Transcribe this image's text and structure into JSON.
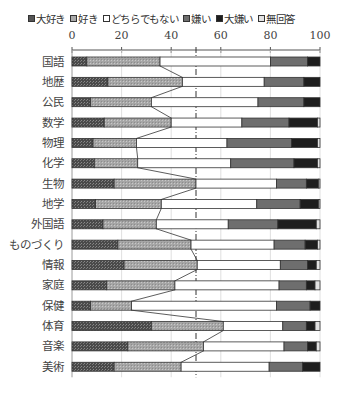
{
  "chart_data": {
    "type": "bar",
    "orientation": "horizontal",
    "stacked": true,
    "percent": true,
    "title": "",
    "xlabel": "",
    "ylabel": "",
    "xlim": [
      0,
      100
    ],
    "xticks": [
      "0",
      "20",
      "40",
      "60",
      "80",
      "100"
    ],
    "reference_line": 50,
    "legend_position": "top",
    "categories": [
      "国語",
      "地歴",
      "公民",
      "数学",
      "物理",
      "化学",
      "生物",
      "地学",
      "外国語",
      "ものづくり",
      "情報",
      "家庭",
      "保健",
      "体育",
      "音楽",
      "美術"
    ],
    "series": [
      {
        "name": "大好き",
        "color": "#5a5a5a",
        "pattern": "dots-dark",
        "values": [
          6,
          14.5,
          7.5,
          13,
          8.5,
          9,
          17,
          9.5,
          12.5,
          18.5,
          21,
          14,
          7.5,
          32,
          22.5,
          17
        ]
      },
      {
        "name": "好き",
        "color": "#a8a8a8",
        "pattern": "dots-light",
        "values": [
          29.5,
          30,
          24.5,
          27,
          17.5,
          17.5,
          33,
          26.5,
          21.5,
          29.5,
          29.5,
          27.5,
          16.5,
          29,
          30.5,
          27
        ]
      },
      {
        "name": "どちらでもない",
        "color": "#ffffff",
        "pattern": "none",
        "values": [
          44.5,
          33,
          43,
          28.5,
          36.5,
          37.5,
          32.5,
          38.5,
          29,
          33.5,
          33.5,
          42,
          58.5,
          24,
          32.5,
          35.5
        ]
      },
      {
        "name": "嫌い",
        "color": "#6e6e6e",
        "pattern": "solid",
        "values": [
          15,
          16,
          18.5,
          19,
          26,
          25.5,
          12,
          17.5,
          20,
          12.5,
          11,
          11,
          13.5,
          9.5,
          9.5,
          13.5
        ]
      },
      {
        "name": "大嫌い",
        "color": "#1e1e1e",
        "pattern": "solid",
        "values": [
          5,
          6.5,
          6.5,
          11.5,
          10.5,
          9.5,
          5,
          7.5,
          15.5,
          5,
          3.5,
          3.5,
          4,
          3.5,
          3.5,
          7
        ]
      },
      {
        "name": "無回答",
        "color": "#e2e2e2",
        "pattern": "none",
        "values": [
          0,
          0,
          0,
          1,
          1,
          1,
          0.5,
          0.5,
          1.5,
          1,
          1.5,
          2,
          0,
          2,
          1.5,
          0
        ]
      }
    ]
  }
}
